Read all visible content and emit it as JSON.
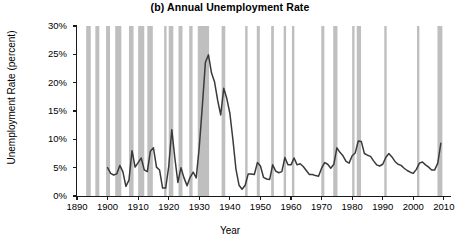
{
  "chart_data": {
    "type": "line",
    "title": "(b) Annual Unemployment Rate",
    "xlabel": "Year",
    "ylabel": "Unemployment Rate (percent)",
    "xlim": [
      1890,
      2012
    ],
    "ylim": [
      0,
      30
    ],
    "grid": false,
    "legend": "none",
    "y_ticks": [
      0,
      5,
      10,
      15,
      20,
      25,
      30
    ],
    "y_tick_labels": [
      "0%",
      "5%",
      "10%",
      "15%",
      "20%",
      "25%",
      "30%"
    ],
    "x_ticks": [
      1890,
      1900,
      1910,
      1920,
      1930,
      1940,
      1950,
      1960,
      1970,
      1980,
      1990,
      2000,
      2010
    ],
    "x_tick_labels": [
      "1890",
      "1900",
      "1910",
      "1920",
      "1930",
      "1940",
      "1950",
      "1960",
      "1970",
      "1980",
      "1990",
      "2000",
      "2010"
    ],
    "line_color": "#3a3a3a",
    "recession_band_color": "#bfbfbf",
    "axis_color": "#1a1a1a",
    "series": [
      {
        "name": "Annual Unemployment Rate",
        "x": [
          1900,
          1901,
          1902,
          1903,
          1904,
          1905,
          1906,
          1907,
          1908,
          1909,
          1910,
          1911,
          1912,
          1913,
          1914,
          1915,
          1916,
          1917,
          1918,
          1919,
          1920,
          1921,
          1922,
          1923,
          1924,
          1925,
          1926,
          1927,
          1928,
          1929,
          1930,
          1931,
          1932,
          1933,
          1934,
          1935,
          1936,
          1937,
          1938,
          1939,
          1940,
          1941,
          1942,
          1943,
          1944,
          1945,
          1946,
          1947,
          1948,
          1949,
          1950,
          1951,
          1952,
          1953,
          1954,
          1955,
          1956,
          1957,
          1958,
          1959,
          1960,
          1961,
          1962,
          1963,
          1964,
          1965,
          1966,
          1967,
          1968,
          1969,
          1970,
          1971,
          1972,
          1973,
          1974,
          1975,
          1976,
          1977,
          1978,
          1979,
          1980,
          1981,
          1982,
          1983,
          1984,
          1985,
          1986,
          1987,
          1988,
          1989,
          1990,
          1991,
          1992,
          1993,
          1994,
          1995,
          1996,
          1997,
          1998,
          1999,
          2000,
          2001,
          2002,
          2003,
          2004,
          2005,
          2006,
          2007,
          2008,
          2009
        ],
        "values": [
          5.0,
          4.0,
          3.7,
          3.9,
          5.4,
          4.3,
          1.7,
          2.8,
          8.0,
          5.1,
          5.9,
          6.7,
          4.6,
          4.3,
          7.9,
          8.5,
          5.1,
          4.6,
          1.4,
          1.4,
          5.2,
          11.7,
          6.7,
          2.4,
          5.0,
          3.2,
          1.8,
          3.3,
          4.2,
          3.2,
          8.7,
          15.9,
          23.6,
          24.9,
          21.7,
          20.1,
          16.9,
          14.3,
          19.0,
          17.2,
          14.6,
          9.9,
          4.7,
          1.9,
          1.2,
          1.9,
          3.9,
          3.9,
          3.8,
          5.9,
          5.3,
          3.3,
          3.0,
          2.9,
          5.5,
          4.4,
          4.1,
          4.3,
          6.8,
          5.5,
          5.5,
          6.7,
          5.5,
          5.7,
          5.2,
          4.5,
          3.8,
          3.8,
          3.6,
          3.5,
          4.9,
          5.9,
          5.6,
          4.9,
          5.6,
          8.5,
          7.7,
          7.1,
          6.1,
          5.8,
          7.1,
          7.6,
          9.7,
          9.6,
          7.5,
          7.2,
          7.0,
          6.2,
          5.5,
          5.3,
          5.6,
          6.8,
          7.5,
          6.9,
          6.1,
          5.6,
          5.4,
          4.9,
          4.5,
          4.2,
          4.0,
          4.7,
          5.8,
          6.0,
          5.5,
          5.1,
          4.6,
          4.6,
          5.8,
          9.3
        ]
      }
    ],
    "recession_bands": [
      {
        "start": 1893.0,
        "end": 1894.5
      },
      {
        "start": 1896.0,
        "end": 1897.3
      },
      {
        "start": 1899.5,
        "end": 1900.8
      },
      {
        "start": 1902.5,
        "end": 1904.5
      },
      {
        "start": 1907.0,
        "end": 1908.5
      },
      {
        "start": 1910.0,
        "end": 1912.0
      },
      {
        "start": 1913.0,
        "end": 1914.8
      },
      {
        "start": 1918.5,
        "end": 1919.2
      },
      {
        "start": 1920.0,
        "end": 1921.5
      },
      {
        "start": 1923.2,
        "end": 1924.5
      },
      {
        "start": 1926.7,
        "end": 1927.8
      },
      {
        "start": 1929.5,
        "end": 1933.2
      },
      {
        "start": 1937.3,
        "end": 1938.5
      },
      {
        "start": 1945.0,
        "end": 1945.8
      },
      {
        "start": 1948.8,
        "end": 1949.8
      },
      {
        "start": 1953.5,
        "end": 1954.4
      },
      {
        "start": 1957.6,
        "end": 1958.3
      },
      {
        "start": 1960.3,
        "end": 1961.1
      },
      {
        "start": 1969.9,
        "end": 1970.9
      },
      {
        "start": 1973.8,
        "end": 1975.2
      },
      {
        "start": 1980.0,
        "end": 1980.5
      },
      {
        "start": 1981.5,
        "end": 1982.9
      },
      {
        "start": 1990.5,
        "end": 1991.2
      },
      {
        "start": 2001.2,
        "end": 2001.9
      },
      {
        "start": 2007.9,
        "end": 2009.5
      }
    ]
  }
}
